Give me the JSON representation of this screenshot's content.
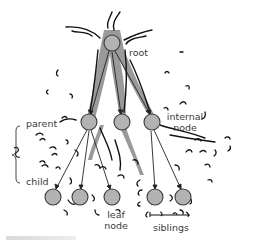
{
  "diagram": {
    "type": "tree",
    "title": "",
    "colors": {
      "node_fill": "#b3b3b3",
      "node_stroke": "#3a3a3a",
      "trunk_fill": "#9a9a9a",
      "edge": "#222222",
      "label": "#3a3a3a",
      "squiggle": "#111111"
    },
    "labels": {
      "root": "root",
      "parent": "parent",
      "child": "child",
      "internal_line1": "internal",
      "internal_line2": "node",
      "leaf_line1": "leaf",
      "leaf_line2": "node",
      "siblings": "siblings"
    },
    "nodes": [
      {
        "id": "root",
        "level": 0,
        "x": 112,
        "y": 43
      },
      {
        "id": "internal-1",
        "level": 1,
        "x": 89,
        "y": 122
      },
      {
        "id": "internal-2",
        "level": 1,
        "x": 122,
        "y": 122
      },
      {
        "id": "internal-3",
        "level": 1,
        "x": 152,
        "y": 122
      },
      {
        "id": "leaf-1",
        "level": 2,
        "x": 53,
        "y": 197
      },
      {
        "id": "leaf-2",
        "level": 2,
        "x": 80,
        "y": 197
      },
      {
        "id": "leaf-3",
        "level": 2,
        "x": 112,
        "y": 197
      },
      {
        "id": "leaf-4",
        "level": 2,
        "x": 155,
        "y": 197
      },
      {
        "id": "leaf-5",
        "level": 2,
        "x": 183,
        "y": 197
      }
    ],
    "edges": [
      {
        "from": "root",
        "to": "internal-1"
      },
      {
        "from": "root",
        "to": "internal-2"
      },
      {
        "from": "root",
        "to": "internal-3"
      },
      {
        "from": "internal-1",
        "to": "leaf-1"
      },
      {
        "from": "internal-1",
        "to": "leaf-2"
      },
      {
        "from": "internal-1",
        "to": "leaf-3"
      },
      {
        "from": "internal-3",
        "to": "leaf-4"
      },
      {
        "from": "internal-3",
        "to": "leaf-5"
      }
    ]
  }
}
